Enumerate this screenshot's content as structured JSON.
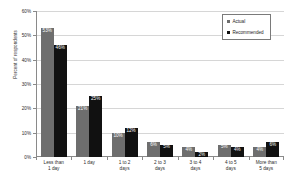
{
  "chart_data": {
    "type": "bar",
    "title": "",
    "xlabel": "",
    "ylabel": "Percent of respondents",
    "ylim": [
      0,
      60
    ],
    "ytick_labels": [
      "0%",
      "10%",
      "20%",
      "30%",
      "40%",
      "50%",
      "60%"
    ],
    "ytick_values": [
      0,
      10,
      20,
      30,
      40,
      50,
      60
    ],
    "grid": true,
    "legend_position": "top-right",
    "categories": [
      "Less than 1 day",
      "1 day",
      "1 to 2 days",
      "2 to 3 days",
      "3 to 4 days",
      "4 to 5 days",
      "More than 5 days"
    ],
    "category_lines": [
      [
        "Less than",
        "1 day"
      ],
      [
        "1 day"
      ],
      [
        "1 to 2",
        "days"
      ],
      [
        "2 to 3",
        "days"
      ],
      [
        "3 to 4",
        "days"
      ],
      [
        "4 to 5",
        "days"
      ],
      [
        "More than",
        "5 days"
      ]
    ],
    "series": [
      {
        "name": "Actual",
        "color": "#6e6e6e",
        "values": [
          53,
          21,
          10,
          6,
          4,
          5,
          4
        ],
        "labels": [
          "53%",
          "21%",
          "10%",
          "6%",
          "4%",
          "5%",
          "4%"
        ]
      },
      {
        "name": "Recommended",
        "color": "#111111",
        "values": [
          46,
          25,
          12,
          5,
          2,
          4,
          6
        ],
        "labels": [
          "46%",
          "25%",
          "12%",
          "5%",
          "2%",
          "4%",
          "6%"
        ]
      }
    ]
  },
  "legend": {
    "items": [
      {
        "label": "Actual",
        "color": "#6e6e6e"
      },
      {
        "label": "Recommended",
        "color": "#111111"
      }
    ]
  },
  "colors": {
    "actual": "#6e6e6e",
    "recommended": "#111111",
    "axis": "#8a8a8a",
    "grid": "#d6d6d6",
    "text": "#2b2b2b",
    "background": "#ffffff"
  }
}
